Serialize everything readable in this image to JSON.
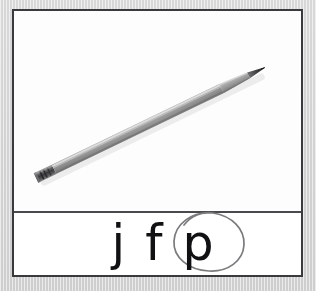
{
  "card": {
    "title": "Beginning sound picture card",
    "picture": {
      "object_name": "pencil",
      "description": "A sharpened yellow-grey wooden pencil shown diagonally, eraser ferrule at lower left and sharp graphite point at upper right",
      "orientation": "diagonal lower-left to upper-right"
    },
    "letters": {
      "options": [
        {
          "label": "j",
          "selected": false
        },
        {
          "label": "f",
          "selected": false
        },
        {
          "label": "p",
          "selected": true
        }
      ],
      "selected_label": "p",
      "selection_mark": "hand-drawn pencil circle"
    }
  },
  "colors": {
    "page_background": "#d9d9d9",
    "card_background": "#ffffff",
    "frame_border": "#3a3a3c",
    "divider": "#4a4a4c",
    "letter_text": "#111114",
    "circle_stroke": "#7b7b7e",
    "pencil_body": "#8f8f8f",
    "pencil_body_light": "#c9c9c9",
    "pencil_body_dark": "#6a6a6a",
    "pencil_ferrule": "#5a5a5c",
    "pencil_tip": "#2b2b2d"
  }
}
